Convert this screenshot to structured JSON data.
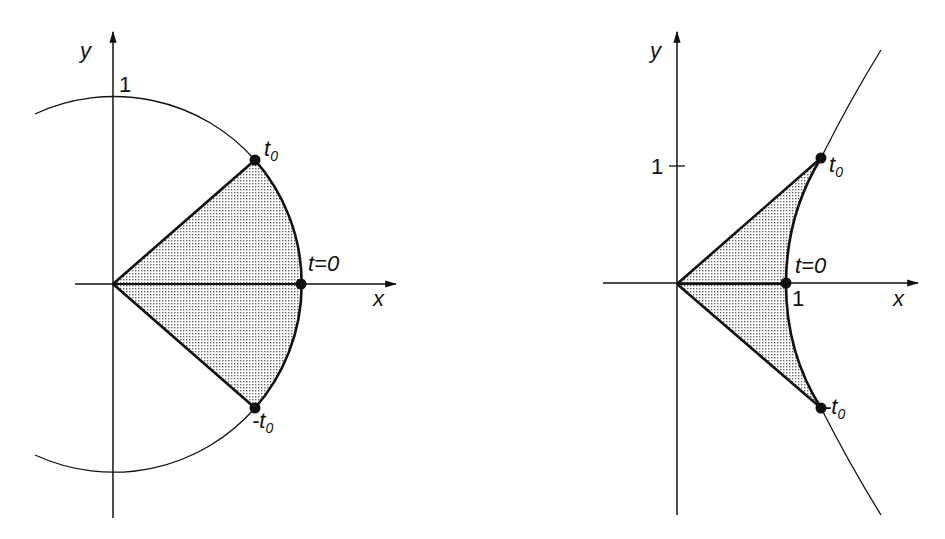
{
  "figures": [
    {
      "name": "circular-sector",
      "axes": {
        "x_label": "x",
        "y_label": "y"
      },
      "tick_labels": {
        "y_one": "1"
      },
      "points": {
        "t0": {
          "label": "t",
          "sub": "0"
        },
        "t_zero": {
          "label": "t=0"
        },
        "minus_t0": {
          "label": "-t",
          "sub": "0"
        }
      }
    },
    {
      "name": "hyperbolic-sector",
      "axes": {
        "x_label": "x",
        "y_label": "y"
      },
      "tick_labels": {
        "y_one": "1",
        "x_one": "1"
      },
      "points": {
        "t0": {
          "label": "t",
          "sub": "0"
        },
        "t_zero": {
          "label": "t=0"
        },
        "minus_t0": {
          "label": "-t",
          "sub": "0"
        }
      }
    }
  ],
  "colors": {
    "line": "#1a1a1a",
    "fill_dots": "#555555"
  }
}
